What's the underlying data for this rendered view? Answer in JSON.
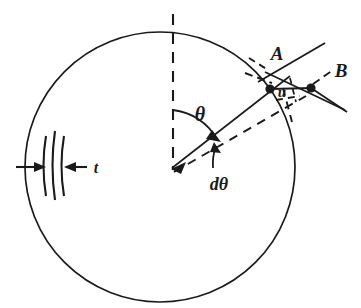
{
  "figure": {
    "background_color": "#ffffff",
    "line_color": "#1a1a1a",
    "labels": {
      "point_a": "A",
      "point_b": "B",
      "displacement": "u",
      "angle": "θ",
      "differential_angle": "dθ",
      "thickness": "t"
    },
    "geometry": {
      "circle_center_x": 160,
      "circle_center_y": 167,
      "circle_radius": 135,
      "point_a_x": 271,
      "point_a_y": 88,
      "point_b_x": 310,
      "point_b_y": 93,
      "theta_degrees": 54,
      "dtheta_degrees": 14
    },
    "elements": [
      {
        "name": "ring-outline",
        "kind": "circle"
      },
      {
        "name": "vertical-centerline",
        "kind": "dashed-line"
      },
      {
        "name": "radius-to-a",
        "kind": "solid-line"
      },
      {
        "name": "radius-dtheta",
        "kind": "dashed-line"
      },
      {
        "name": "theta-arc",
        "kind": "arc-with-arrow"
      },
      {
        "name": "dtheta-arc",
        "kind": "arc-with-arrow"
      },
      {
        "name": "tangent-line-a",
        "kind": "solid-line"
      },
      {
        "name": "tangent-line-b",
        "kind": "solid-line"
      },
      {
        "name": "thickness-dimension",
        "kind": "dimension-arrows"
      }
    ]
  }
}
